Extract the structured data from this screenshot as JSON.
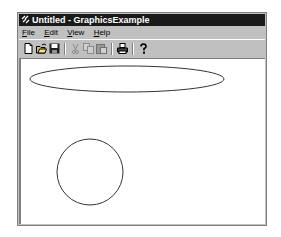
{
  "window": {
    "title": "Untitled - GraphicsExample"
  },
  "menu": {
    "items": [
      {
        "label": "File",
        "mnemonic": "F",
        "rest": "ile"
      },
      {
        "label": "Edit",
        "mnemonic": "E",
        "rest": "dit"
      },
      {
        "label": "View",
        "mnemonic": "V",
        "rest": "iew"
      },
      {
        "label": "Help",
        "mnemonic": "H",
        "rest": "elp"
      }
    ]
  },
  "toolbar": {
    "buttons": [
      {
        "icon": "new-document-icon",
        "enabled": true
      },
      {
        "icon": "open-folder-icon",
        "enabled": true
      },
      {
        "icon": "save-disk-icon",
        "enabled": true
      },
      {
        "icon": "cut-scissors-icon",
        "enabled": false
      },
      {
        "icon": "copy-icon",
        "enabled": false
      },
      {
        "icon": "paste-icon",
        "enabled": false
      },
      {
        "icon": "print-icon",
        "enabled": true
      },
      {
        "icon": "help-about-icon",
        "enabled": true
      }
    ]
  },
  "canvas": {
    "shapes": [
      {
        "type": "ellipse",
        "cx": 106,
        "cy": 20,
        "rx": 97,
        "ry": 13
      },
      {
        "type": "circle",
        "cx": 69,
        "cy": 113,
        "r": 33
      }
    ],
    "stroke": "#333333"
  },
  "colors": {
    "titlebar": "#1a1a1a",
    "chrome": "#c0c0c0",
    "client": "#ffffff"
  }
}
